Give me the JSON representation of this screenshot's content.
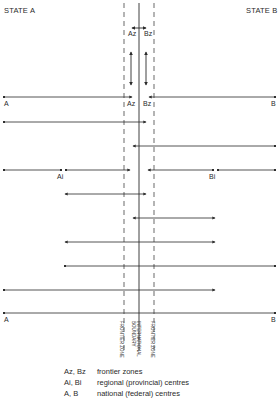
{
  "header": {
    "state_a": "STATE A",
    "state_b": "STATE B"
  },
  "labels": {
    "az": "Az",
    "bz": "Bz",
    "a": "A",
    "b": "B",
    "ai": "Ai",
    "bi": "Bi"
  },
  "vertical_labels": {
    "frontier_left": "FRONTIER ZONE",
    "boundary_line1": "INTERNATIONAL",
    "boundary_line2": "BOUNDARY",
    "frontier_right": "FRONTIER ZONE"
  },
  "legend": [
    {
      "key": "Az, Bz",
      "desc": "frontier zones"
    },
    {
      "key": "Ai, Bi",
      "desc": "regional (provincial) centres"
    },
    {
      "key": "A, B",
      "desc": "national (federal) centres"
    }
  ],
  "colors": {
    "ink": "#2a2a2a",
    "background": "#ffffff"
  }
}
